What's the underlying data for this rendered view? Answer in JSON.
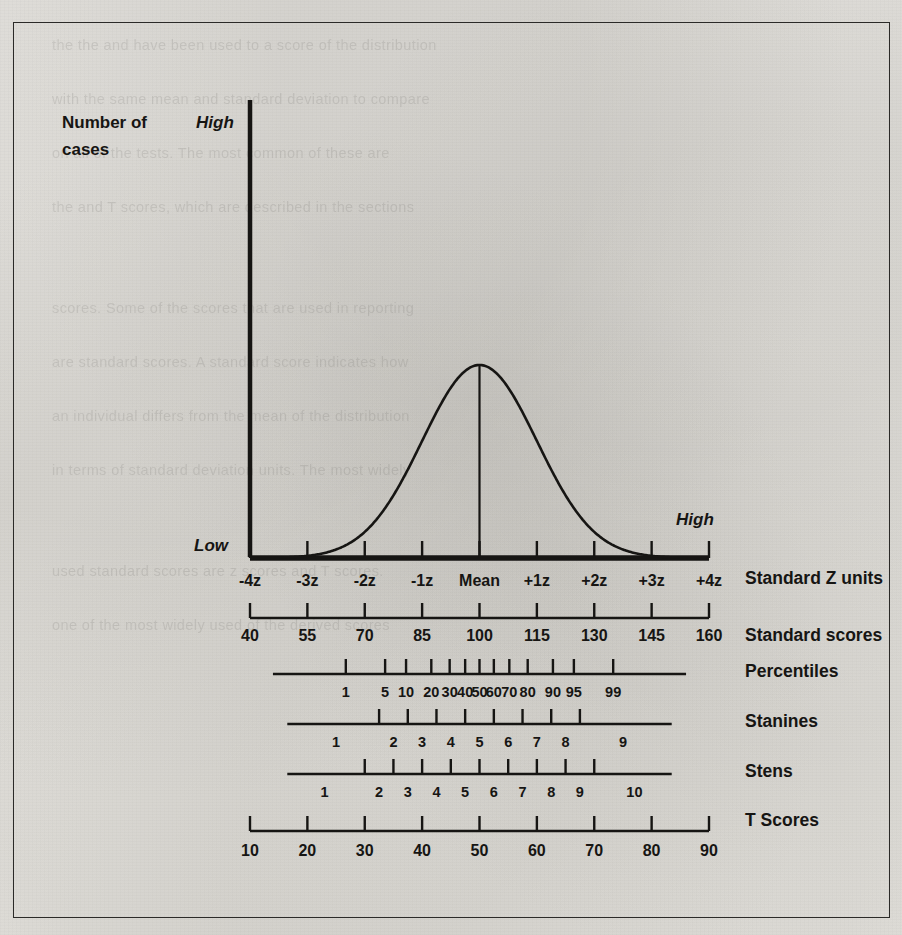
{
  "figure": {
    "y_axis_label_line1": "Number of",
    "y_axis_label_line2": "cases",
    "y_axis_high": "High",
    "y_axis_low": "Low",
    "x_axis_high": "High"
  },
  "row_labels": {
    "z": "Standard Z units",
    "standard": "Standard scores",
    "percentiles": "Percentiles",
    "stanines": "Stanines",
    "stens": "Stens",
    "tscores": "T Scores"
  },
  "bleed_text": [
    "the the and have been used to a score of the distribution",
    "with the same mean and standard deviation to compare",
    "on all of the tests. The most common of these are",
    "the and T scores, which are described in the sections",
    "scores. Some of the scores that are used in reporting",
    "are standard scores. A standard score indicates how",
    "an individual differs from the mean of the distribution",
    "in terms of standard deviation units. The most widely",
    "used standard scores are z scores and T scores.",
    "one of the most widely used of the derived scores"
  ],
  "chart_data": {
    "type": "line",
    "title": "",
    "xlabel": "",
    "ylabel": "Number of cases",
    "xlim": [
      -4,
      4
    ],
    "ylim": [
      0,
      1
    ],
    "grid": false,
    "legend": "none",
    "curve": "normal distribution (gaussian) density, mean 0, sd 1",
    "mean_line_z": 0,
    "scales": [
      {
        "name": "Standard Z units",
        "labels": [
          "-4z",
          "-3z",
          "-2z",
          "-1z",
          "Mean",
          "+1z",
          "+2z",
          "+3z",
          "+4z"
        ],
        "z": [
          -4,
          -3,
          -2,
          -1,
          0,
          1,
          2,
          3,
          4
        ],
        "label_placement": "at-tick"
      },
      {
        "name": "Standard scores",
        "labels": [
          "40",
          "55",
          "70",
          "85",
          "100",
          "115",
          "130",
          "145",
          "160"
        ],
        "z": [
          -4,
          -3,
          -2,
          -1,
          0,
          1,
          2,
          3,
          4
        ],
        "label_placement": "at-tick"
      },
      {
        "name": "Percentiles",
        "labels": [
          "1",
          "5",
          "10",
          "20",
          "30",
          "40",
          "50",
          "60",
          "70",
          "80",
          "90",
          "95",
          "99"
        ],
        "z": [
          -2.33,
          -1.645,
          -1.28,
          -0.84,
          -0.52,
          -0.25,
          0,
          0.25,
          0.52,
          0.84,
          1.28,
          1.645,
          2.33
        ],
        "label_placement": "at-tick"
      },
      {
        "name": "Stanines",
        "labels": [
          "1",
          "2",
          "3",
          "4",
          "5",
          "6",
          "7",
          "8",
          "9"
        ],
        "tick_z": [
          -1.75,
          -1.25,
          -0.75,
          -0.25,
          0.25,
          0.75,
          1.25,
          1.75
        ],
        "label_z": [
          -2.5,
          -1.5,
          -1.0,
          -0.5,
          0,
          0.5,
          1.0,
          1.5,
          2.5
        ],
        "label_placement": "between-ticks"
      },
      {
        "name": "Stens",
        "labels": [
          "1",
          "2",
          "3",
          "4",
          "5",
          "6",
          "7",
          "8",
          "9",
          "10"
        ],
        "tick_z": [
          -2,
          -1.5,
          -1,
          -0.5,
          0,
          0.5,
          1,
          1.5,
          2
        ],
        "label_z": [
          -2.7,
          -1.75,
          -1.25,
          -0.75,
          -0.25,
          0.25,
          0.75,
          1.25,
          1.75,
          2.7
        ],
        "label_placement": "between-ticks"
      },
      {
        "name": "T Scores",
        "labels": [
          "10",
          "20",
          "30",
          "40",
          "50",
          "60",
          "70",
          "80",
          "90"
        ],
        "z": [
          -4,
          -3,
          -2,
          -1,
          0,
          1,
          2,
          3,
          4
        ],
        "label_placement": "at-tick"
      }
    ]
  },
  "colors": {
    "ink": "#161513",
    "paper": "#e9e8e4",
    "border": "#2b2a28"
  }
}
